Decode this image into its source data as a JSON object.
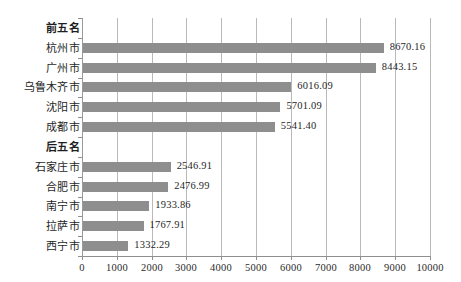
{
  "chart_data": {
    "type": "bar",
    "orientation": "horizontal",
    "title": "",
    "xlabel": "",
    "ylabel": "",
    "xlim": [
      0,
      10000
    ],
    "xticks": [
      "0",
      "1000",
      "2000",
      "3000",
      "4000",
      "5000",
      "6000",
      "7000",
      "8000",
      "9000",
      "10000"
    ],
    "xtick_values": [
      0,
      1000,
      2000,
      3000,
      4000,
      5000,
      6000,
      7000,
      8000,
      9000,
      10000
    ],
    "grid": true,
    "legend": "none",
    "bar_color": "#8e8e8e",
    "groups": [
      {
        "label": "前五名",
        "categories": [
          "杭州市",
          "广州市",
          "乌鲁木齐市",
          "沈阳市",
          "成都市"
        ],
        "values": [
          8670.16,
          8443.15,
          6016.09,
          5701.09,
          5541.4
        ],
        "value_labels": [
          "8670.16",
          "8443.15",
          "6016.09",
          "5701.09",
          "5541.40"
        ]
      },
      {
        "label": "后五名",
        "categories": [
          "石家庄市",
          "合肥市",
          "南宁市",
          "拉萨市",
          "西宁市"
        ],
        "values": [
          2546.91,
          2476.99,
          1933.86,
          1767.91,
          1332.29
        ],
        "value_labels": [
          "2546.91",
          "2476.99",
          "1933.86",
          "1767.91",
          "1332.29"
        ]
      }
    ],
    "rows": [
      {
        "label": "前五名",
        "is_group": true,
        "value": null,
        "value_label": ""
      },
      {
        "label": "杭州市",
        "is_group": false,
        "value": 8670.16,
        "value_label": "8670.16"
      },
      {
        "label": "广州市",
        "is_group": false,
        "value": 8443.15,
        "value_label": "8443.15"
      },
      {
        "label": "乌鲁木齐市",
        "is_group": false,
        "value": 6016.09,
        "value_label": "6016.09"
      },
      {
        "label": "沈阳市",
        "is_group": false,
        "value": 5701.09,
        "value_label": "5701.09"
      },
      {
        "label": "成都市",
        "is_group": false,
        "value": 5541.4,
        "value_label": "5541.40"
      },
      {
        "label": "后五名",
        "is_group": true,
        "value": null,
        "value_label": ""
      },
      {
        "label": "石家庄市",
        "is_group": false,
        "value": 2546.91,
        "value_label": "2546.91"
      },
      {
        "label": "合肥市",
        "is_group": false,
        "value": 2476.99,
        "value_label": "2476.99"
      },
      {
        "label": "南宁市",
        "is_group": false,
        "value": 1933.86,
        "value_label": "1933.86"
      },
      {
        "label": "拉萨市",
        "is_group": false,
        "value": 1767.91,
        "value_label": "1767.91"
      },
      {
        "label": "西宁市",
        "is_group": false,
        "value": 1332.29,
        "value_label": "1332.29"
      }
    ]
  }
}
